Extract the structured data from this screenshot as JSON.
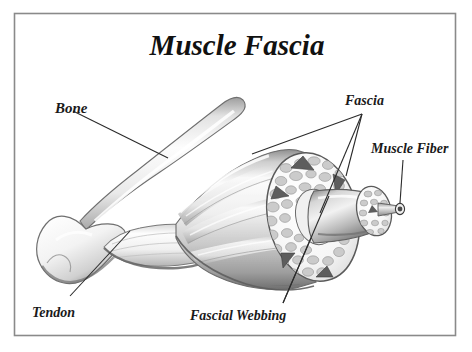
{
  "figure": {
    "title": "Muscle Fascia",
    "border_color": "#808080",
    "background_color": "#ffffff",
    "ink_color": "#1a1a1a"
  },
  "labels": {
    "bone": "Bone",
    "tendon": "Tendon",
    "fascia": "Fascia",
    "muscle_fiber": "Muscle Fiber",
    "fascial_webbing": "Fascial Webbing"
  },
  "illustration": {
    "style": "grayscale airbrushed anatomical drawing",
    "parts": [
      "bone-shaft",
      "bone-condyle",
      "tendon",
      "muscle-belly",
      "muscle-cut-cross-section",
      "fascicle-bundle",
      "single-muscle-fiber"
    ],
    "palette": {
      "bone_light": "#fbfbfb",
      "bone_mid": "#d9d9d9",
      "bone_shadow": "#8e8e8e",
      "muscle_light": "#f4f4f4",
      "muscle_mid": "#c6c6c6",
      "muscle_dark": "#7d7d7d",
      "fascicle_fill": "#cfcfcf",
      "outline": "#4a4a4a"
    }
  }
}
